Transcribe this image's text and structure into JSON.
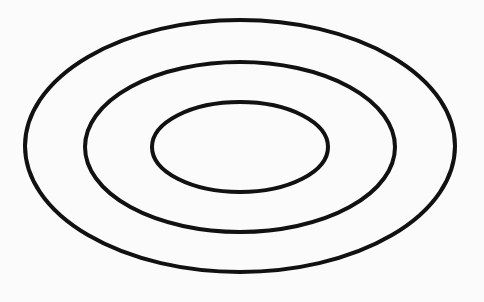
{
  "diagram": {
    "type": "concentric-ellipses",
    "background": "#fbfbfb",
    "stroke_color": "#111111",
    "stroke_width": 4,
    "ellipses": [
      {
        "name": "outer",
        "cx": 240,
        "cy": 146,
        "rx": 215,
        "ry": 126
      },
      {
        "name": "middle",
        "cx": 240,
        "cy": 147,
        "rx": 155,
        "ry": 85
      },
      {
        "name": "inner",
        "cx": 240,
        "cy": 147,
        "rx": 88,
        "ry": 45
      }
    ]
  }
}
